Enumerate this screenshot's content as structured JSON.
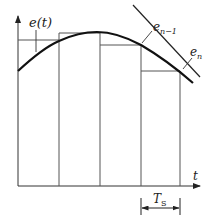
{
  "diagram": {
    "labels": {
      "signal": "e(t)",
      "e_prev_base": "e",
      "e_prev_sub": "n−1",
      "e_curr_base": "e",
      "e_curr_sub": "n",
      "time_axis": "t",
      "period_base": "T",
      "period_sub": "S"
    },
    "colors": {
      "stroke": "#222222",
      "thin": "#555555",
      "background": "#ffffff"
    },
    "geometry": {
      "axis_origin": [
        18,
        186
      ],
      "sample_lines_x": [
        18,
        59,
        100,
        141,
        180
      ],
      "hold_levels_y": [
        40,
        33,
        45,
        71
      ]
    }
  }
}
